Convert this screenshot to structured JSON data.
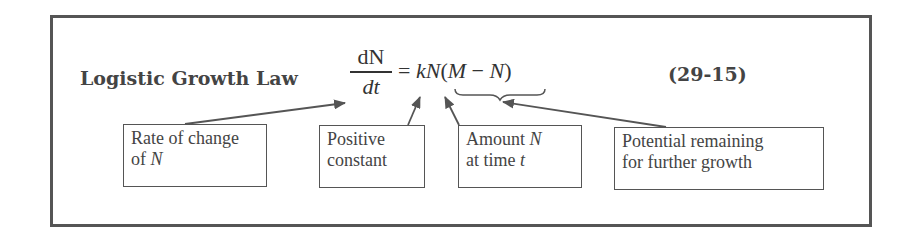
{
  "title": "Logistic Growth Law",
  "equation": {
    "numerator": "dN",
    "denominator": "dt",
    "equals": "=",
    "k": "k",
    "N": "N",
    "open_paren": "(",
    "M": "M",
    "minus": "−",
    "N2": "N",
    "close_paren": ")",
    "number": "(29-15)"
  },
  "labels": [
    {
      "line1": "Rate of change",
      "line2_prefix": "of ",
      "line2_var": "N",
      "line2_suffix": ""
    },
    {
      "line1": "Positive",
      "line2_prefix": "constant",
      "line2_var": "",
      "line2_suffix": ""
    },
    {
      "line1_prefix": "Amount ",
      "line1_var": "N",
      "line2_prefix": "at time ",
      "line2_var": "t"
    },
    {
      "line1": "Potential remaining",
      "line2_prefix": "for further growth",
      "line2_var": "",
      "line2_suffix": ""
    }
  ]
}
